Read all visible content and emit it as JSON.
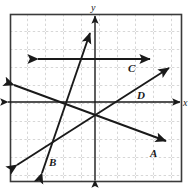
{
  "figure": {
    "type": "coordinate-plane-graph",
    "background": "#ffffff",
    "plot_area": {
      "x": 10,
      "y": 14,
      "width": 172,
      "height": 168,
      "border_color": "#3a3a3a",
      "grid": {
        "visible": true,
        "style": "dashed",
        "color": "#a8a8a8",
        "spacing_px": 18
      }
    },
    "axes": {
      "x_label": "x",
      "y_label": "y",
      "x_axis_y_px": 102,
      "y_axis_x_px": 95,
      "color": "#1a1a1a",
      "arrowheads": "both-ends"
    },
    "line_color": "#1a1a1a",
    "lines": [
      {
        "label": "A",
        "description": "Line with negative slope from upper-left to lower-right",
        "slope_sign": "negative",
        "arrowheads": "both-ends",
        "x1": 14,
        "y1": 85,
        "x2": 166,
        "y2": 141,
        "label_x": 150,
        "label_y": 157
      },
      {
        "label": "B",
        "description": "Steep line with large positive slope",
        "slope_sign": "positive-steep",
        "arrowheads": "both-ends",
        "x1": 42,
        "y1": 173,
        "x2": 90,
        "y2": 33,
        "label_x": 49,
        "label_y": 166
      },
      {
        "label": "C",
        "description": "Horizontal line above the x-axis",
        "slope_sign": "zero",
        "arrowheads": "both-ends",
        "x1": 38,
        "y1": 59,
        "x2": 150,
        "y2": 59,
        "label_x": 128,
        "label_y": 72
      },
      {
        "label": "D",
        "description": "Line with moderate positive slope from lower-left to upper-right",
        "slope_sign": "positive",
        "arrowheads": "both-ends",
        "x1": 17,
        "y1": 165,
        "x2": 169,
        "y2": 68,
        "label_x": 137,
        "label_y": 99
      }
    ],
    "labels": {
      "a": "A",
      "b": "B",
      "c": "C",
      "d": "D",
      "x": "x",
      "y": "y"
    }
  }
}
